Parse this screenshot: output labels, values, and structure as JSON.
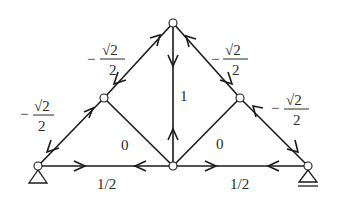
{
  "diagram": {
    "type": "truss",
    "nodes": {
      "A": {
        "x": 38,
        "y": 166,
        "support": "pin"
      },
      "B": {
        "x": 104,
        "y": 98
      },
      "C": {
        "x": 173,
        "y": 23
      },
      "D": {
        "x": 240,
        "y": 98
      },
      "E": {
        "x": 308,
        "y": 166,
        "support": "roller"
      },
      "F": {
        "x": 173,
        "y": 166
      }
    },
    "members": [
      {
        "id": "AB",
        "label": "-√2/2"
      },
      {
        "id": "BC",
        "label": "-√2/2"
      },
      {
        "id": "CD",
        "label": "-√2/2"
      },
      {
        "id": "DE",
        "label": "-√2/2"
      },
      {
        "id": "CF",
        "label": "1"
      },
      {
        "id": "BF",
        "label": "0"
      },
      {
        "id": "DF",
        "label": "0"
      },
      {
        "id": "AF",
        "label": "1/2"
      },
      {
        "id": "FE",
        "label": "1/2"
      }
    ],
    "labels": {
      "ab_minus": "−",
      "ab_num": "√2",
      "ab_den": "2",
      "bc_minus": "−",
      "bc_num": "√2",
      "bc_den": "2",
      "cd_minus": "−",
      "cd_num": "√2",
      "cd_den": "2",
      "de_minus": "−",
      "de_num": "√2",
      "de_den": "2",
      "cf": "1",
      "bf": "0",
      "df": "0",
      "af": "1/2",
      "fe": "1/2"
    }
  }
}
